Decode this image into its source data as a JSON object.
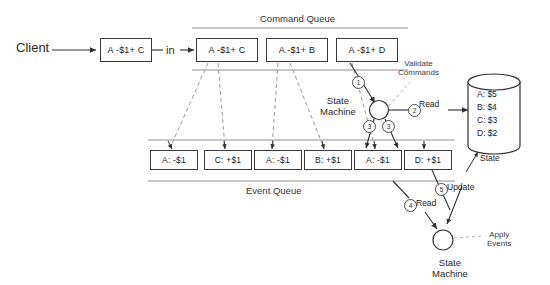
{
  "diagram": {
    "client": {
      "label": "Client",
      "command_box": "A -$1+ C",
      "in_label": "in"
    },
    "command_queue": {
      "title": "Command Queue",
      "commands": [
        {
          "text": "A -$1+ C"
        },
        {
          "text": "A -$1+ B"
        },
        {
          "text": "A -$1+ D"
        }
      ]
    },
    "event_queue": {
      "title": "Event Queue",
      "events": [
        {
          "text": "A: -$1"
        },
        {
          "text": "C: +$1"
        },
        {
          "text": "A: -$1"
        },
        {
          "text": "B: +$1"
        },
        {
          "text": "A: -$1"
        },
        {
          "text": "D: +$1"
        }
      ]
    },
    "state_machine_top": {
      "line1": "State",
      "line2": "Machine",
      "annotation_line1": "Validate",
      "annotation_line2": "Commands"
    },
    "state_machine_bottom": {
      "line1": "State",
      "line2": "Machine",
      "annotation_line1": "Apply",
      "annotation_line2": "Events"
    },
    "database": {
      "label": "State",
      "rows": [
        {
          "text": "A: $5"
        },
        {
          "text": "B: $4"
        },
        {
          "text": "C: $3"
        },
        {
          "text": "D: $2"
        }
      ]
    },
    "steps": [
      {
        "number": "1",
        "label": ""
      },
      {
        "number": "2",
        "label": "Read"
      },
      {
        "number": "3",
        "label": ""
      },
      {
        "number": "3",
        "label": ""
      },
      {
        "number": "4",
        "label": "Read"
      },
      {
        "number": "5",
        "label": "Update"
      }
    ],
    "step_labels": {
      "read2": "Read",
      "read4": "Read",
      "update5": "Update"
    },
    "colors": {
      "stroke": "#3a3a3a",
      "dashed": "#8a8a8a",
      "background": "#ffffff",
      "text": "#1d1d1d"
    }
  }
}
